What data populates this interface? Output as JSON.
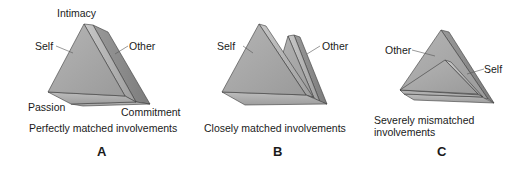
{
  "panels": [
    {
      "id": "A",
      "letter": "A",
      "caption": "Perfectly matched involvements",
      "labels": {
        "intimacy": "Intimacy",
        "self": "Self",
        "other": "Other",
        "passion": "Passion",
        "commitment": "Commitment"
      }
    },
    {
      "id": "B",
      "letter": "B",
      "caption": "Closely matched involvements",
      "labels": {
        "self": "Self",
        "other": "Other"
      }
    },
    {
      "id": "C",
      "letter": "C",
      "caption_line1": "Severely mismatched",
      "caption_line2": "involvements",
      "labels": {
        "other": "Other",
        "self": "Self"
      }
    }
  ],
  "colors": {
    "front_face": "#a9a9a9",
    "side_face": "#8f8f8f",
    "top_edge": "#c4c4c4",
    "outline": "#3a3a3a",
    "text": "#1a1a1a"
  }
}
